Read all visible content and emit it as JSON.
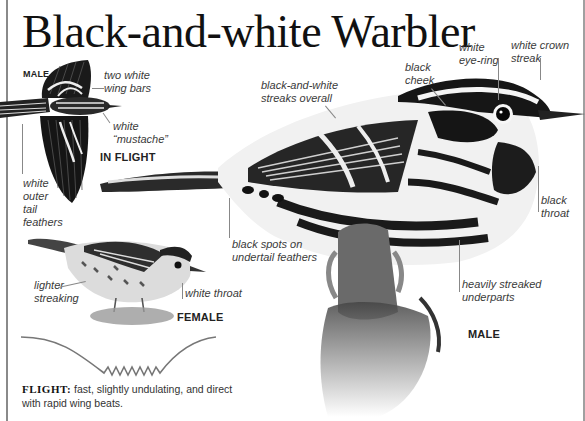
{
  "title": "Black-and-white Warbler",
  "inflight_panel": {
    "sex_tag": "MALE",
    "view_tag": "IN FLIGHT",
    "labels": {
      "wing_bars": [
        "two white",
        "wing bars"
      ],
      "mustache": [
        "white",
        "“mustache”"
      ],
      "tail": [
        "white",
        "outer",
        "tail",
        "feathers"
      ]
    }
  },
  "female_panel": {
    "sex_tag": "FEMALE",
    "labels": {
      "streaking": [
        "lighter",
        "streaking"
      ],
      "throat": "white throat"
    }
  },
  "male_panel": {
    "sex_tag": "MALE",
    "labels": {
      "streaks": [
        "black-and-white",
        "streaks overall"
      ],
      "cheek": [
        "black",
        "cheek"
      ],
      "eyering": [
        "white",
        "eye-ring"
      ],
      "crown": [
        "white crown",
        "streak"
      ],
      "throat": [
        "black",
        "throat"
      ],
      "undertail": [
        "black spots on",
        "undertail feathers"
      ],
      "underparts": [
        "heavily streaked",
        "underparts"
      ]
    }
  },
  "flight": {
    "heading": "FLIGHT:",
    "description": "fast, slightly undulating, and direct with rapid wing beats."
  },
  "colors": {
    "frame": "#8a8a8a",
    "title": "#111111",
    "label": "#3a3a3a",
    "flight_path": "#777777"
  }
}
